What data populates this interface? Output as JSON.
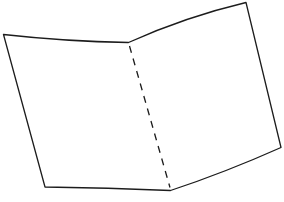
{
  "figure": {
    "background_color": "#ffffff",
    "stroke_color": "#1c1c1c",
    "stroke_width": "1.3",
    "outline_path": "M 3.5 34.5 Q 66 41.5 128.5 42.5 Q 185 17 246 2.5 L 281 147.5 Q 225 172.5 170.5 190.5 Q 108 187.5 45 187 Z",
    "fold_line_path": "M 129.5 46 L 170 187.5",
    "fold_dash": "7 6"
  }
}
